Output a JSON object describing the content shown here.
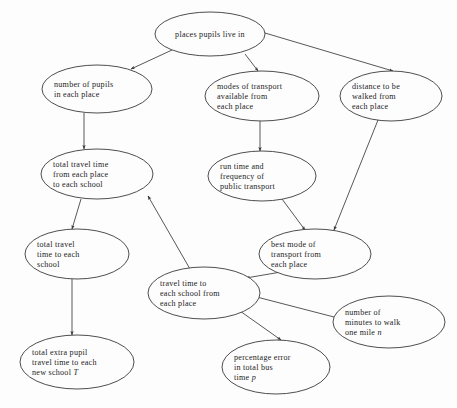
{
  "diagram": {
    "type": "flow-diagram",
    "background_color": "#fdfdfd",
    "node_stroke_color": "#3a3a3a",
    "edge_stroke_color": "#3a3a3a",
    "text_color": "#1c1c1c",
    "nodes": [
      {
        "id": "places",
        "name": "places-pupils-live-in",
        "cx": 210,
        "cy": 34,
        "rx": 55,
        "ry": 22,
        "lines": [
          {
            "text": "places pupils live in",
            "italic_tail": ""
          }
        ]
      },
      {
        "id": "pupils",
        "name": "number-of-pupils-in-each-place",
        "cx": 97,
        "cy": 89,
        "rx": 55,
        "ry": 24,
        "lines": [
          {
            "text": "number of pupils",
            "italic_tail": ""
          },
          {
            "text": "in each place",
            "italic_tail": ""
          }
        ]
      },
      {
        "id": "modes",
        "name": "modes-of-transport-available-from-each-place",
        "cx": 262,
        "cy": 96,
        "rx": 57,
        "ry": 25,
        "lines": [
          {
            "text": "modes of transport",
            "italic_tail": ""
          },
          {
            "text": "available from",
            "italic_tail": ""
          },
          {
            "text": "each place",
            "italic_tail": ""
          }
        ]
      },
      {
        "id": "distance",
        "name": "distance-to-be-walked-from-each-place",
        "cx": 391,
        "cy": 96,
        "rx": 51,
        "ry": 25,
        "lines": [
          {
            "text": "distance to be",
            "italic_tail": ""
          },
          {
            "text": "walked from",
            "italic_tail": ""
          },
          {
            "text": "each place",
            "italic_tail": ""
          }
        ]
      },
      {
        "id": "total-from-place",
        "name": "total-travel-time-from-each-place-to-each-school",
        "cx": 97,
        "cy": 174,
        "rx": 56,
        "ry": 25,
        "lines": [
          {
            "text": "total travel time",
            "italic_tail": ""
          },
          {
            "text": "from each place",
            "italic_tail": ""
          },
          {
            "text": "to each school",
            "italic_tail": ""
          }
        ]
      },
      {
        "id": "run-time",
        "name": "run-time-and-frequency-of-public-transport",
        "cx": 262,
        "cy": 176,
        "rx": 54,
        "ry": 25,
        "lines": [
          {
            "text": "run time and",
            "italic_tail": ""
          },
          {
            "text": "frequency of",
            "italic_tail": ""
          },
          {
            "text": "public transport",
            "italic_tail": ""
          }
        ]
      },
      {
        "id": "total-each-school",
        "name": "total-travel-time-to-each-school",
        "cx": 77,
        "cy": 254,
        "rx": 52,
        "ry": 25,
        "lines": [
          {
            "text": "total travel",
            "italic_tail": ""
          },
          {
            "text": "time to each",
            "italic_tail": ""
          },
          {
            "text": "school",
            "italic_tail": ""
          }
        ]
      },
      {
        "id": "best-mode",
        "name": "best-mode-of-transport-from-each-place",
        "cx": 315,
        "cy": 254,
        "rx": 56,
        "ry": 25,
        "lines": [
          {
            "text": "best mode of",
            "italic_tail": ""
          },
          {
            "text": "transport from",
            "italic_tail": ""
          },
          {
            "text": "each place",
            "italic_tail": ""
          }
        ]
      },
      {
        "id": "travel-time-place",
        "name": "travel-time-to-each-school-from-each-place",
        "cx": 204,
        "cy": 293,
        "rx": 56,
        "ry": 26,
        "lines": [
          {
            "text": "travel time to",
            "italic_tail": ""
          },
          {
            "text": "each school from",
            "italic_tail": ""
          },
          {
            "text": "each place",
            "italic_tail": ""
          }
        ]
      },
      {
        "id": "minutes-walk",
        "name": "number-of-minutes-to-walk-one-mile",
        "cx": 389,
        "cy": 322,
        "rx": 56,
        "ry": 26,
        "lines": [
          {
            "text": "number of",
            "italic_tail": ""
          },
          {
            "text": "minutes to walk",
            "italic_tail": ""
          },
          {
            "text": "one mile ",
            "italic_tail": "n"
          }
        ]
      },
      {
        "id": "extra-pupil",
        "name": "total-extra-pupil-travel-time-to-each-new-school",
        "cx": 77,
        "cy": 362,
        "rx": 57,
        "ry": 27,
        "lines": [
          {
            "text": "total extra pupil",
            "italic_tail": ""
          },
          {
            "text": "travel time to each",
            "italic_tail": ""
          },
          {
            "text": "new school ",
            "italic_tail": "T"
          }
        ]
      },
      {
        "id": "percentage-error",
        "name": "percentage-error-in-total-bus-time",
        "cx": 276,
        "cy": 367,
        "rx": 54,
        "ry": 27,
        "lines": [
          {
            "text": "percentage error",
            "italic_tail": ""
          },
          {
            "text": "in total bus",
            "italic_tail": ""
          },
          {
            "text": "time ",
            "italic_tail": "p"
          }
        ]
      }
    ],
    "edges": [
      {
        "name": "edge-places-to-pupils",
        "from": "places",
        "to": "pupils",
        "x1": 172,
        "y1": 50,
        "x2": 131,
        "y2": 69
      },
      {
        "name": "edge-places-to-modes",
        "from": "places",
        "to": "modes",
        "x1": 245,
        "y1": 54,
        "x2": 258,
        "y2": 71
      },
      {
        "name": "edge-places-to-distance",
        "from": "places",
        "to": "distance",
        "x1": 265,
        "y1": 33,
        "x2": 393,
        "y2": 71
      },
      {
        "name": "edge-pupils-to-total-from-place",
        "from": "pupils",
        "to": "total-from-place",
        "x1": 84,
        "y1": 113,
        "x2": 84,
        "y2": 149
      },
      {
        "name": "edge-modes-to-run-time",
        "from": "modes",
        "to": "run-time",
        "x1": 260,
        "y1": 121,
        "x2": 260,
        "y2": 151
      },
      {
        "name": "edge-total-from-place-to-total-each-school",
        "from": "total-from-place",
        "to": "total-each-school",
        "x1": 81,
        "y1": 199,
        "x2": 72,
        "y2": 229
      },
      {
        "name": "edge-travel-time-place-to-total-from-place",
        "from": "travel-time-place",
        "to": "total-from-place",
        "x1": 190,
        "y1": 269,
        "x2": 148,
        "y2": 196
      },
      {
        "name": "edge-total-each-school-to-extra-pupil",
        "from": "total-each-school",
        "to": "extra-pupil",
        "x1": 72,
        "y1": 279,
        "x2": 72,
        "y2": 335
      },
      {
        "name": "edge-run-time-to-best-mode",
        "from": "run-time",
        "to": "best-mode",
        "x1": 282,
        "y1": 199,
        "x2": 305,
        "y2": 230
      },
      {
        "name": "edge-distance-to-best-mode",
        "from": "distance",
        "to": "best-mode",
        "x1": 378,
        "y1": 120,
        "x2": 334,
        "y2": 230
      },
      {
        "name": "edge-best-mode-to-travel-time-place",
        "from": "best-mode",
        "to": "travel-time-place",
        "x1": 281,
        "y1": 272,
        "x2": 246,
        "y2": 278
      },
      {
        "name": "edge-minutes-walk-to-travel-time-place",
        "from": "minutes-walk",
        "to": "travel-time-place",
        "x1": 334,
        "y1": 317,
        "x2": 249,
        "y2": 295
      },
      {
        "name": "edge-travel-time-place-to-percentage-error",
        "from": "travel-time-place",
        "to": "percentage-error",
        "x1": 240,
        "y1": 311,
        "x2": 281,
        "y2": 340
      }
    ]
  }
}
